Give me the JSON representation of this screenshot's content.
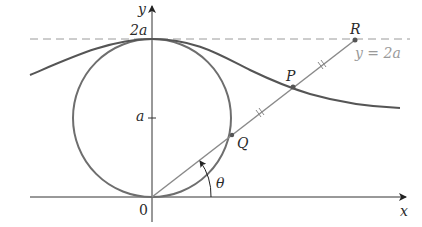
{
  "diagram": {
    "axes": {
      "x_label": "x",
      "y_label": "y",
      "origin_label": "0"
    },
    "y_ticks": [
      {
        "label": "a",
        "value": "a"
      },
      {
        "label": "2a",
        "value": "2a"
      }
    ],
    "dashed_line_label": "y = 2a",
    "points": {
      "P": "P",
      "Q": "Q",
      "R": "R"
    },
    "angle_label": "θ",
    "colors": {
      "curve": "#555555",
      "circle": "#6e6e6e",
      "ray": "#8a8a8a",
      "axes": "#333333",
      "dashed": "#9a9a9a"
    }
  }
}
